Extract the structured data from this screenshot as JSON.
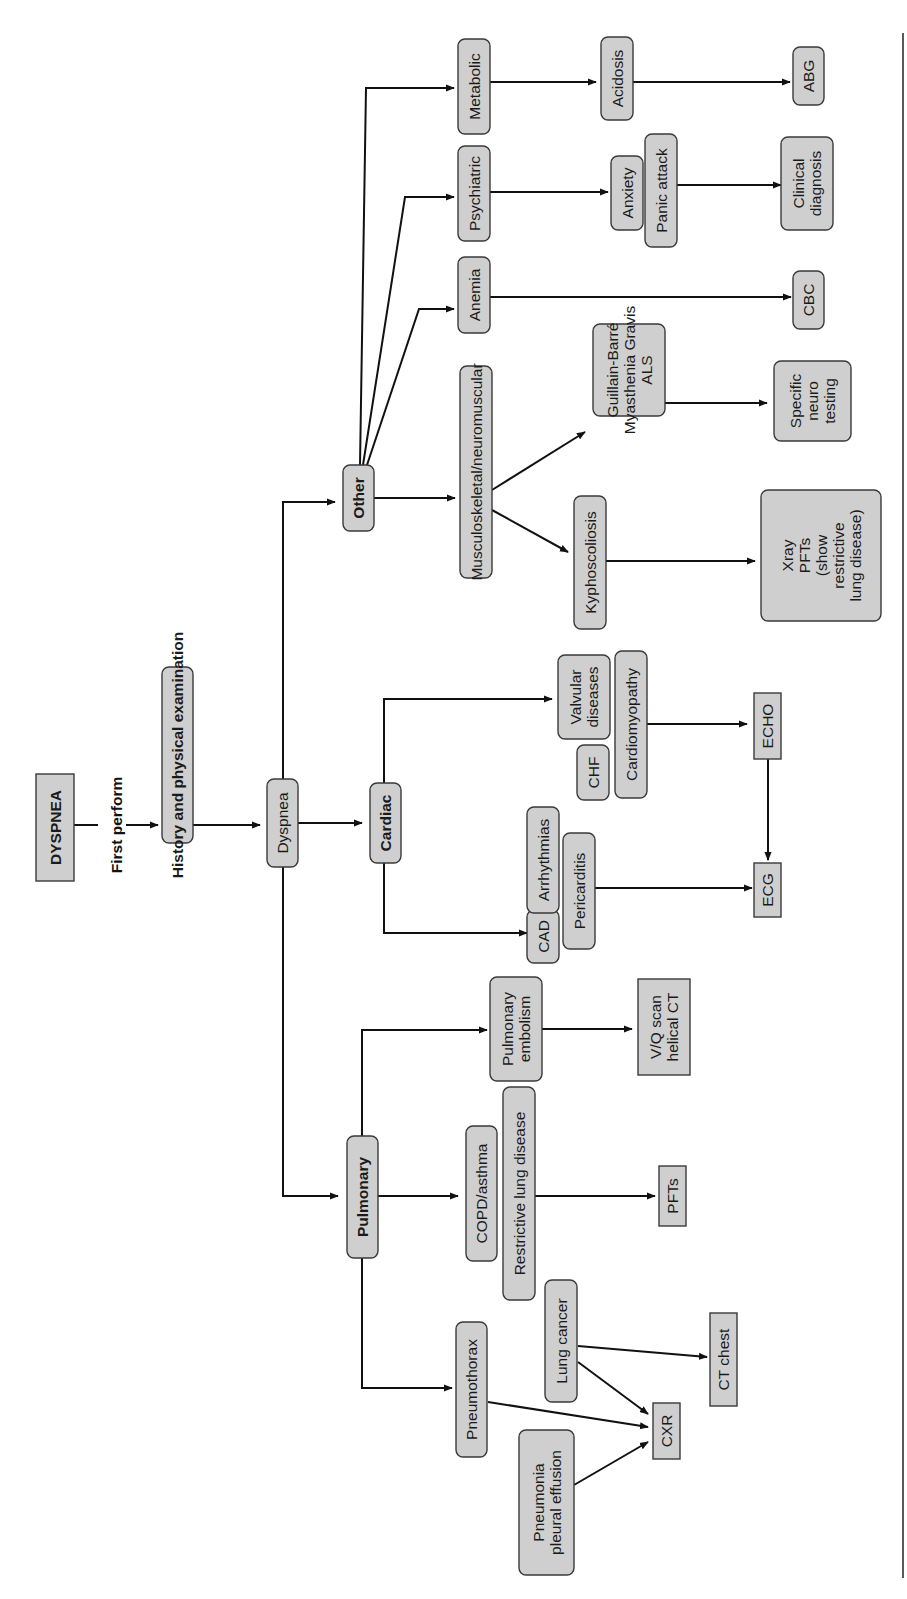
{
  "figure": {
    "orientation": "rotated-90-ccw",
    "start": "DYSPNEA",
    "first_step_label": "First perform",
    "nodes": {
      "dyspnea_title": "DYSPNEA",
      "history": "History and physical examination",
      "dyspnea": "Dyspnea",
      "pulmonary": "Pulmonary",
      "cardiac": "Cardiac",
      "other": "Other",
      "pneumothorax": "Pneumothorax",
      "pneumonia": [
        "Pneumonia",
        "pleural effusion"
      ],
      "lung_cancer": "Lung cancer",
      "copd": "COPD/asthma",
      "restrictive": "Restrictive lung disease",
      "pe": [
        "Pulmonary",
        "embolism"
      ],
      "cxr": "CXR",
      "ct_chest": "CT chest",
      "pfts": "PFTs",
      "vq": [
        "V/Q scan",
        "helical CT"
      ],
      "cad": "CAD",
      "arrhythmias": "Arrhythmias",
      "pericarditis": "Pericarditis",
      "chf": "CHF",
      "valvular": [
        "Valvular",
        "diseases"
      ],
      "cardiomyopathy": "Cardiomyopathy",
      "ecg": "ECG",
      "echo": "ECHO",
      "musculo": "Musculoskeletal/neuromuscular",
      "kypho": "Kyphoscoliosis",
      "neuro_dz": [
        "Guillain-Barré",
        "Myasthenia Gravis",
        "ALS"
      ],
      "xray_pfts": [
        "Xray",
        "PFTs",
        "(show",
        "restrictive",
        "lung disease)"
      ],
      "neuro_test": [
        "Specific",
        "neuro",
        "testing"
      ],
      "anemia": "Anemia",
      "cbc": "CBC",
      "psychiatric": "Psychiatric",
      "anxiety": "Anxiety",
      "panic": "Panic attack",
      "clinical": [
        "Clinical",
        "diagnosis"
      ],
      "metabolic": "Metabolic",
      "acidosis": "Acidosis",
      "abg": "ABG"
    }
  },
  "colors": {
    "node_fill": "#cfcfcf",
    "node_stroke": "#3a3a3a",
    "edge": "#111111",
    "background": "#ffffff"
  }
}
